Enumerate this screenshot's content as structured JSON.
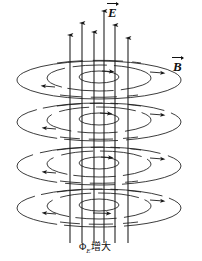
{
  "figure": {
    "background_color": "#ffffff",
    "stroke_color": "#1a1a1a",
    "width": 202,
    "height": 261
  },
  "labels": {
    "electric_field": {
      "symbol": "E",
      "name": "electric-field-vector-label",
      "vector": true,
      "x": 107,
      "y": 6
    },
    "magnetic_field": {
      "symbol": "B",
      "name": "magnetic-field-vector-label",
      "vector": true,
      "x": 172,
      "y": 60
    },
    "flux_caption": {
      "prefix": "Φ",
      "subscript": "E",
      "suffix": "增大",
      "full": "ΦE增大",
      "x": 79,
      "y": 242
    }
  },
  "electric_field_lines": [
    {
      "x": 70,
      "top": 35,
      "bottom": 243,
      "arrow_y": 35
    },
    {
      "x": 82,
      "top": 23,
      "bottom": 243,
      "arrow_y": 23
    },
    {
      "x": 94,
      "top": 32,
      "bottom": 243,
      "arrow_y": 32
    },
    {
      "x": 104,
      "top": 11,
      "bottom": 243,
      "arrow_y": 11
    },
    {
      "x": 115,
      "top": 25,
      "bottom": 243,
      "arrow_y": 25
    },
    {
      "x": 128,
      "top": 38,
      "bottom": 243,
      "arrow_y": 38
    }
  ],
  "magnetic_field_levels": [
    {
      "level": 1,
      "center_y": 80,
      "rings": [
        {
          "rx": 20,
          "ry": 6,
          "dash": "none"
        },
        {
          "rx": 52,
          "ry": 13,
          "dash": "segmented"
        },
        {
          "rx": 82,
          "ry": 19,
          "dash": "none"
        }
      ]
    },
    {
      "level": 2,
      "center_y": 122,
      "rings": [
        {
          "rx": 20,
          "ry": 6,
          "dash": "none"
        },
        {
          "rx": 52,
          "ry": 13,
          "dash": "segmented"
        },
        {
          "rx": 82,
          "ry": 19,
          "dash": "none"
        }
      ]
    },
    {
      "level": 3,
      "center_y": 166,
      "rings": [
        {
          "rx": 20,
          "ry": 6,
          "dash": "none"
        },
        {
          "rx": 52,
          "ry": 13,
          "dash": "segmented"
        },
        {
          "rx": 82,
          "ry": 19,
          "dash": "none"
        }
      ]
    },
    {
      "level": 4,
      "center_y": 208,
      "rings": [
        {
          "rx": 20,
          "ry": 6,
          "dash": "none"
        },
        {
          "rx": 52,
          "ry": 13,
          "dash": "segmented"
        },
        {
          "rx": 82,
          "ry": 19,
          "dash": "none"
        }
      ]
    }
  ],
  "axis_center_x": 99
}
